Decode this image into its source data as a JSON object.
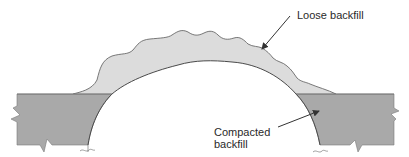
{
  "diagram": {
    "labels": {
      "loose_backfill": "Loose backfill",
      "compacted_backfill_line1": "Compacted",
      "compacted_backfill_line2": "backfill"
    },
    "colors": {
      "loose_fill": "#dcdcdc",
      "compacted_fill": "#a9a9a9",
      "outline": "#5a5a5a",
      "arrow": "#333333",
      "text": "#2a2a2a",
      "background": "#ffffff"
    }
  }
}
